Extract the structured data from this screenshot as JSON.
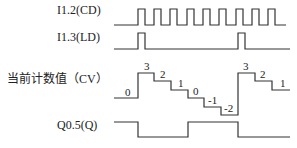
{
  "signals": {
    "cd": {
      "label": "I1.2(CD)"
    },
    "ld": {
      "label": "I1.3(LD)"
    },
    "cv": {
      "label": "当前计数值（CV）"
    },
    "q": {
      "label": "Q0.5(Q)"
    }
  },
  "cv_values": [
    "0",
    "3",
    "2",
    "1",
    "0",
    "-1",
    "-2",
    "3",
    "2",
    "1"
  ],
  "colors": {
    "line": "#333333",
    "text": "#222222",
    "background": "#ffffff"
  }
}
